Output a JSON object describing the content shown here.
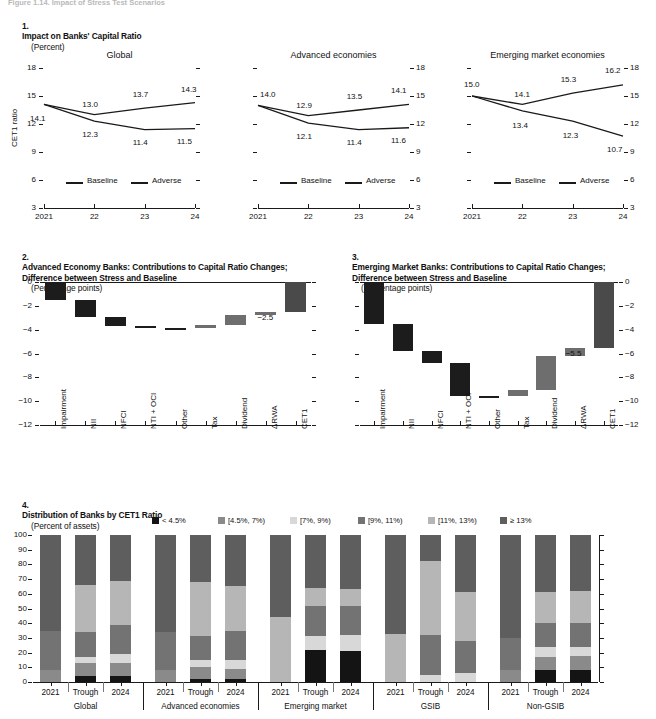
{
  "figure": {
    "supertitle": "Figure 1.14. Impact of Stress Test Scenarios",
    "panel1": {
      "number": "1.",
      "title": "Impact on Banks' Capital Ratio",
      "subtitle": "(Percent)",
      "ylabel": "CET1 ratio",
      "legend": [
        "Baseline",
        "Adverse"
      ],
      "yticks": [
        "18",
        "15",
        "12",
        "9",
        "6",
        "3"
      ],
      "xticks": [
        "2021",
        "22",
        "23",
        "24"
      ]
    },
    "panel2": {
      "number": "2.",
      "title": "Advanced Economy Banks: Contributions to Capital Ratio Changes;\nDifference between Stress and Baseline",
      "subtitle": "(Percentage points)",
      "yticks": [
        "0",
        "-2",
        "-4",
        "-6",
        "-8",
        "-10",
        "-12"
      ]
    },
    "panel3": {
      "number": "3.",
      "title": "Emerging Market Banks: Contributions to Capital Ratio Changes;\nDifference between Stress and Baseline",
      "subtitle": "(Percentage points)",
      "yticks": [
        "0",
        "-2",
        "-4",
        "-6",
        "-8",
        "-10",
        "-12"
      ]
    },
    "panel4": {
      "number": "4.",
      "title": "Distribution of Banks by CET1 Ratio",
      "subtitle": "(Percent of assets)",
      "yticks": [
        "100",
        "90",
        "80",
        "70",
        "60",
        "50",
        "40",
        "30",
        "20",
        "10",
        "0"
      ]
    }
  },
  "colors": {
    "line": "#1a1a1a",
    "wf_negative": "#1c1c1c",
    "wf_positive": "#6e6e6e",
    "wf_total": "#4a4a4a",
    "b1": "#141414",
    "b2": "#8a8a8a",
    "b3": "#d8d8d8",
    "b4": "#737373",
    "b5": "#b6b6b6",
    "b6": "#5e5e5e"
  },
  "chart_data": [
    {
      "type": "line",
      "id": "global",
      "title": "Global",
      "xlabel": "",
      "ylabel": "CET1 ratio",
      "x": [
        "2021",
        "22",
        "23",
        "24"
      ],
      "ylim": [
        3,
        18
      ],
      "yticks": [
        3,
        6,
        9,
        12,
        15,
        18
      ],
      "grid": false,
      "legend": [
        "Baseline",
        "Adverse"
      ],
      "legend_position": "inside-bottom",
      "series": [
        {
          "name": "Baseline",
          "values": [
            14.1,
            13.0,
            13.7,
            14.3
          ]
        },
        {
          "name": "Adverse",
          "values": [
            14.1,
            12.3,
            11.4,
            11.5
          ]
        }
      ],
      "annotations": [
        "14.1",
        "13.0",
        "13.7",
        "14.3",
        "12.3",
        "11.4",
        "11.5"
      ]
    },
    {
      "type": "line",
      "id": "advanced-economies",
      "title": "Advanced economies",
      "xlabel": "",
      "ylabel": "",
      "x": [
        "2021",
        "22",
        "23",
        "24"
      ],
      "ylim": [
        3,
        18
      ],
      "yticks": [
        3,
        6,
        9,
        12,
        15,
        18
      ],
      "grid": false,
      "legend": [
        "Baseline",
        "Adverse"
      ],
      "series": [
        {
          "name": "Baseline",
          "values": [
            14.0,
            12.9,
            13.5,
            14.1
          ]
        },
        {
          "name": "Adverse",
          "values": [
            14.0,
            12.1,
            11.4,
            11.6
          ]
        }
      ],
      "annotations": [
        "14.0",
        "12.9",
        "13.5",
        "14.1",
        "12.1",
        "11.4",
        "11.6"
      ]
    },
    {
      "type": "line",
      "id": "emerging-market-economies",
      "title": "Emerging market economies",
      "xlabel": "",
      "ylabel": "",
      "x": [
        "2021",
        "22",
        "23",
        "24"
      ],
      "ylim": [
        3,
        18
      ],
      "yticks": [
        3,
        6,
        9,
        12,
        15,
        18
      ],
      "grid": false,
      "legend": [
        "Baseline",
        "Adverse"
      ],
      "series": [
        {
          "name": "Baseline",
          "values": [
            15.0,
            14.1,
            15.3,
            16.2
          ]
        },
        {
          "name": "Adverse",
          "values": [
            15.0,
            13.4,
            12.3,
            10.7
          ]
        }
      ],
      "annotations": [
        "15.0",
        "14.1",
        "15.3",
        "16.2",
        "13.4",
        "12.3",
        "10.7"
      ]
    },
    {
      "type": "bar",
      "id": "ae-waterfall",
      "title": "Advanced Economy Banks: Contributions to Capital Ratio Changes; Difference between Stress and Baseline",
      "ylabel": "Percentage points",
      "ylim": [
        -12,
        0
      ],
      "yticks": [
        0,
        -2,
        -4,
        -6,
        -8,
        -10,
        -12
      ],
      "grid": false,
      "categories": [
        "Impairment",
        "NII",
        "NFCI",
        "NTI + OCI",
        "Other",
        "Tax",
        "Dividend",
        "ΔRWA",
        "CET1"
      ],
      "deltas": [
        -1.5,
        -1.4,
        -0.8,
        -0.2,
        0.0,
        0.3,
        0.8,
        0.3,
        0
      ],
      "bar_spans": [
        {
          "from": 0.0,
          "to": -1.5
        },
        {
          "from": -1.5,
          "to": -2.9
        },
        {
          "from": -2.9,
          "to": -3.7
        },
        {
          "from": -3.7,
          "to": -3.9
        },
        {
          "from": -3.9,
          "to": -3.9
        },
        {
          "from": -3.9,
          "to": -3.6
        },
        {
          "from": -3.6,
          "to": -2.8
        },
        {
          "from": -2.8,
          "to": -2.5
        },
        {
          "from": 0.0,
          "to": -2.5
        }
      ],
      "total_label": "-2.5"
    },
    {
      "type": "bar",
      "id": "em-waterfall",
      "title": "Emerging Market Banks: Contributions to Capital Ratio Changes; Difference between Stress and Baseline",
      "ylabel": "Percentage points",
      "ylim": [
        -12,
        0
      ],
      "yticks": [
        0,
        -2,
        -4,
        -6,
        -8,
        -10,
        -12
      ],
      "grid": false,
      "categories": [
        "Impairment",
        "NII",
        "NFCI",
        "NTI + OCI",
        "Other",
        "Tax",
        "Dividend",
        "ΔRWA",
        "CET1"
      ],
      "deltas": [
        -3.5,
        -2.3,
        -1.0,
        -2.8,
        0.0,
        0.5,
        2.9,
        0.7,
        0
      ],
      "bar_spans": [
        {
          "from": 0.0,
          "to": -3.5
        },
        {
          "from": -3.5,
          "to": -5.8
        },
        {
          "from": -5.8,
          "to": -6.8
        },
        {
          "from": -6.8,
          "to": -9.6
        },
        {
          "from": -9.6,
          "to": -9.6
        },
        {
          "from": -9.6,
          "to": -9.1
        },
        {
          "from": -9.1,
          "to": -6.2
        },
        {
          "from": -6.2,
          "to": -5.5
        },
        {
          "from": 0.0,
          "to": -5.5
        }
      ],
      "total_label": "-5.5"
    },
    {
      "type": "bar",
      "id": "distribution-of-banks",
      "subtype": "stacked-100",
      "title": "Distribution of Banks by CET1 Ratio",
      "ylabel": "Percent of assets",
      "ylim": [
        0,
        100
      ],
      "yticks": [
        0,
        10,
        20,
        30,
        40,
        50,
        60,
        70,
        80,
        90,
        100
      ],
      "grid": false,
      "legend": [
        "< 4.5%",
        "[4.5%, 7%)",
        "[7%, 9%)",
        "[9%, 11%)",
        "[11%, 13%)",
        "≥ 13%"
      ],
      "legend_position": "top",
      "groups": [
        "Global",
        "Advanced economies",
        "Emerging market",
        "GSIB",
        "Non-GSIB"
      ],
      "categories": [
        "2021",
        "Trough",
        "2024",
        "2021",
        "Trough",
        "2024",
        "2021",
        "Trough",
        "2024",
        "2021",
        "Trough",
        "2024",
        "2021",
        "Trough",
        "2024"
      ],
      "series": [
        {
          "name": "< 4.5%",
          "values": [
            0,
            4,
            4,
            0,
            2,
            2,
            0,
            22,
            21,
            0,
            0,
            0,
            0,
            8,
            8
          ]
        },
        {
          "name": "[4.5%, 7%)",
          "values": [
            8,
            9,
            9,
            8,
            8,
            7,
            0,
            0,
            0,
            0,
            0,
            0,
            8,
            9,
            10
          ]
        },
        {
          "name": "[7%, 9%)",
          "values": [
            0,
            4,
            6,
            0,
            5,
            6,
            0,
            9,
            11,
            0,
            5,
            6,
            0,
            7,
            6
          ]
        },
        {
          "name": "[9%, 11%)",
          "values": [
            27,
            17,
            20,
            26,
            16,
            20,
            0,
            21,
            20,
            0,
            27,
            22,
            22,
            16,
            16
          ]
        },
        {
          "name": "[11%, 13%)",
          "values": [
            0,
            32,
            30,
            0,
            37,
            30,
            44,
            12,
            11,
            33,
            50,
            33,
            0,
            21,
            22
          ]
        },
        {
          "name": "≥ 13%",
          "values": [
            65,
            34,
            31,
            66,
            32,
            35,
            56,
            36,
            37,
            67,
            18,
            39,
            70,
            39,
            38
          ]
        }
      ]
    }
  ],
  "legend_items": [
    {
      "label": "< 4.5%",
      "color": "#141414"
    },
    {
      "label": "[4.5%, 7%)",
      "color": "#8a8a8a"
    },
    {
      "label": "[7%, 9%)",
      "color": "#d8d8d8"
    },
    {
      "label": "[9%, 11%)",
      "color": "#737373"
    },
    {
      "label": "[11%, 13%)",
      "color": "#b6b6b6"
    },
    {
      "label": "≥ 13%",
      "color": "#5e5e5e"
    }
  ]
}
